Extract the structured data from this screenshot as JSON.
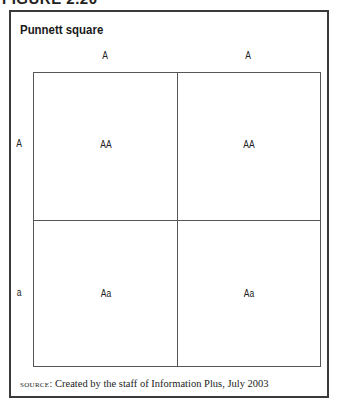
{
  "figure_label": "FIGURE 2.20",
  "title": "Punnett square",
  "columns": [
    "A",
    "A"
  ],
  "rows": [
    "A",
    "a"
  ],
  "cells": [
    [
      "AA",
      "AA"
    ],
    [
      "Aa",
      "Aa"
    ]
  ],
  "source": {
    "prefix": "source:",
    "text": "Created by the staff of Information Plus, July 2003"
  }
}
